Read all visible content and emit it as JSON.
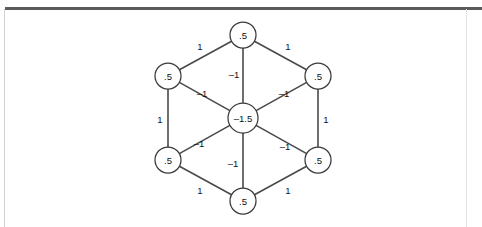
{
  "page": {
    "background_color": "#ffffff",
    "rule_color": "#5b5b5b",
    "frame_color": "#d2d2d2",
    "scan_residue_text": ""
  },
  "diagram": {
    "type": "graph",
    "shape": "hexagon-with-center",
    "node_stroke_color": "#3a3a3a",
    "node_fill_color": "#ffffff",
    "edge_color": "#4a4a4a",
    "text_color": "#111111",
    "nodes": [
      {
        "id": "top",
        "label": ".5",
        "cx": 243,
        "cy": 35,
        "r": 13
      },
      {
        "id": "upper-left",
        "label": ".5",
        "cx": 168,
        "cy": 76,
        "r": 13
      },
      {
        "id": "upper-right",
        "label": ".5",
        "cx": 318,
        "cy": 76,
        "r": 13
      },
      {
        "id": "center",
        "label": "–1.5",
        "cx": 243,
        "cy": 118,
        "r": 15
      },
      {
        "id": "lower-left",
        "label": ".5",
        "cx": 168,
        "cy": 160,
        "r": 13
      },
      {
        "id": "lower-right",
        "label": ".5",
        "cx": 318,
        "cy": 160,
        "r": 13
      },
      {
        "id": "bottom",
        "label": ".5",
        "cx": 243,
        "cy": 201,
        "r": 13
      }
    ],
    "edges": [
      {
        "id": "top--upper-left",
        "from": "upper-left",
        "to": "top",
        "label": "1",
        "lx": 200,
        "ly": 46
      },
      {
        "id": "top--upper-right",
        "from": "top",
        "to": "upper-right",
        "label": "1",
        "lx": 288,
        "ly": 46
      },
      {
        "id": "upper-left--lower-left",
        "from": "upper-left",
        "to": "lower-left",
        "label": "1",
        "lx": 160,
        "ly": 119
      },
      {
        "id": "upper-right--lower-right",
        "from": "upper-right",
        "to": "lower-right",
        "label": "1",
        "lx": 326,
        "ly": 119
      },
      {
        "id": "lower-left--bottom",
        "from": "lower-left",
        "to": "bottom",
        "label": "1",
        "lx": 200,
        "ly": 190
      },
      {
        "id": "lower-right--bottom",
        "from": "bottom",
        "to": "lower-right",
        "label": "1",
        "lx": 288,
        "ly": 190
      },
      {
        "id": "center--top",
        "from": "center",
        "to": "top",
        "label": "–1",
        "lx": 234,
        "ly": 74
      },
      {
        "id": "center--upper-left",
        "from": "center",
        "to": "upper-left",
        "label": "–1",
        "lx": 202,
        "ly": 93
      },
      {
        "id": "center--upper-right",
        "from": "center",
        "to": "upper-right",
        "label": "–1",
        "lx": 284,
        "ly": 93
      },
      {
        "id": "center--lower-left",
        "from": "center",
        "to": "lower-left",
        "label": "–1",
        "lx": 199,
        "ly": 143
      },
      {
        "id": "center--lower-right",
        "from": "center",
        "to": "lower-right",
        "label": "–1",
        "lx": 285,
        "ly": 146
      },
      {
        "id": "center--bottom",
        "from": "center",
        "to": "bottom",
        "label": "–1",
        "lx": 233,
        "ly": 163
      }
    ]
  }
}
